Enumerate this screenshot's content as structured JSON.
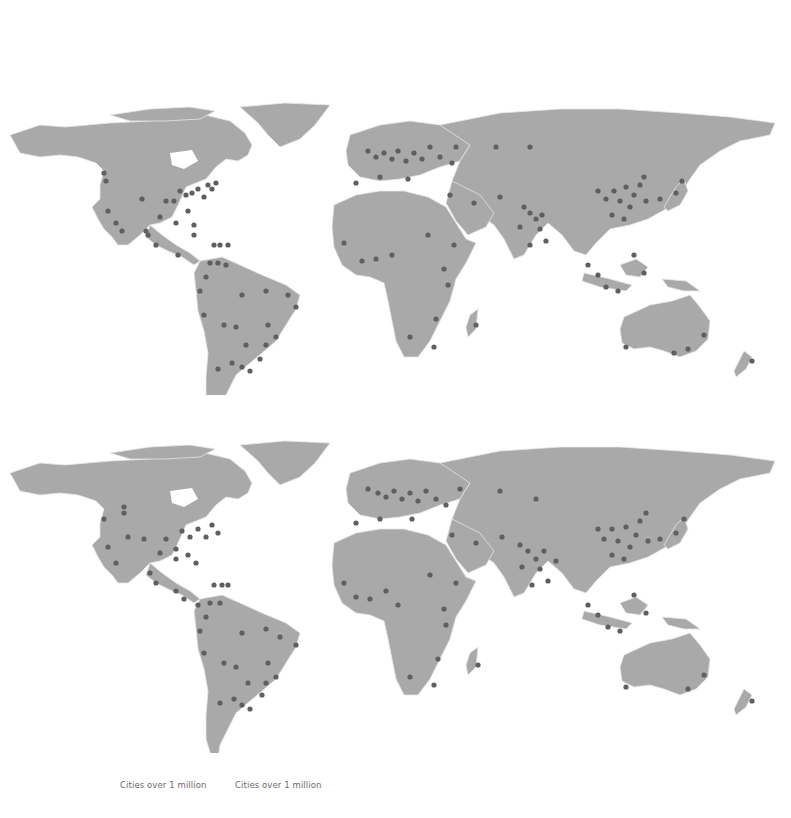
{
  "figure": {
    "maps": [
      {
        "id": "map-top",
        "caption": "Cities over 1 million"
      },
      {
        "id": "map-bottom",
        "caption": "Cities over 1 million"
      }
    ],
    "colors": {
      "land": "#a9a9a9",
      "borders": "#e6e6e6",
      "city_dot": "#5f5f5f",
      "background": "#ffffff"
    },
    "legend": {
      "caption_left": "Cities over 1 million",
      "caption_right": "Cities over 1 million"
    }
  }
}
